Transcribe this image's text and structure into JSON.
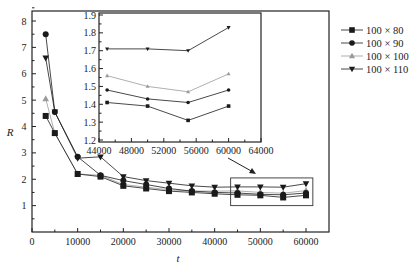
{
  "chart_data": {
    "type": "line",
    "title": "",
    "xlabel": "t",
    "ylabel": "R",
    "xlim": [
      0,
      65000
    ],
    "ylim": [
      0,
      8.5
    ],
    "x_ticks": [
      0,
      10000,
      20000,
      30000,
      40000,
      50000,
      60000
    ],
    "y_ticks": [
      1,
      2,
      3,
      4,
      5,
      6,
      7,
      8
    ],
    "grid": false,
    "legend_position": "right",
    "x": [
      3000,
      5000,
      10000,
      15000,
      20000,
      25000,
      30000,
      35000,
      40000,
      45000,
      50000,
      55000,
      60000
    ],
    "series": [
      {
        "name": "100 × 80",
        "marker": "square",
        "color": "#1a1a1a",
        "values": [
          4.4,
          3.75,
          2.2,
          2.1,
          1.75,
          1.65,
          1.55,
          1.5,
          1.45,
          1.41,
          1.39,
          1.31,
          1.39
        ]
      },
      {
        "name": "100 × 90",
        "marker": "circle",
        "color": "#1a1a1a",
        "values": [
          7.5,
          4.55,
          2.85,
          2.15,
          1.95,
          1.8,
          1.65,
          1.55,
          1.5,
          1.48,
          1.43,
          1.41,
          1.48
        ]
      },
      {
        "name": "100 × 100",
        "marker": "triangle-up",
        "color": "#9a9a9a",
        "values": [
          5.05,
          3.75,
          2.2,
          2.15,
          1.8,
          1.7,
          1.6,
          1.55,
          1.55,
          1.56,
          1.5,
          1.47,
          1.57
        ]
      },
      {
        "name": "100 × 110",
        "marker": "triangle-down",
        "color": "#1a1a1a",
        "values": [
          6.6,
          4.55,
          2.8,
          2.85,
          2.1,
          1.95,
          1.85,
          1.75,
          1.7,
          1.71,
          1.71,
          1.7,
          1.83
        ]
      }
    ],
    "inset": {
      "xlim": [
        44000,
        64000
      ],
      "ylim": [
        1.2,
        1.9
      ],
      "x_ticks": [
        44000,
        48000,
        52000,
        56000,
        60000,
        64000
      ],
      "y_ticks": [
        1.2,
        1.3,
        1.4,
        1.5,
        1.6,
        1.7,
        1.8,
        1.9
      ],
      "x": [
        45000,
        50000,
        55000,
        60000
      ],
      "series": [
        {
          "name": "100 × 80",
          "values": [
            1.41,
            1.39,
            1.31,
            1.39
          ]
        },
        {
          "name": "100 × 90",
          "values": [
            1.48,
            1.43,
            1.41,
            1.48
          ]
        },
        {
          "name": "100 × 100",
          "values": [
            1.56,
            1.5,
            1.47,
            1.57
          ]
        },
        {
          "name": "100 × 110",
          "values": [
            1.71,
            1.71,
            1.7,
            1.83
          ]
        }
      ]
    },
    "annotations": [
      "zoom box around t=45000–60000 with arrow pointing to inset"
    ]
  },
  "labels": {
    "xlabel": "t",
    "ylabel": "R"
  }
}
